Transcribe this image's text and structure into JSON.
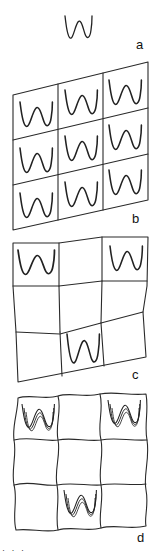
{
  "figure": {
    "panels": [
      {
        "id": "a",
        "label": "a",
        "description": "single double-well potential curve"
      },
      {
        "id": "b",
        "label": "b",
        "description": "3x3 parallelogram grid, each cell containing a double-well curve"
      },
      {
        "id": "c",
        "label": "c",
        "description": "distorted 3x3 grid, double-well curves in top-left, top-right and bottom-center cells only"
      },
      {
        "id": "d",
        "label": "d",
        "description": "wavy 3x3 grid, triple overlapping double-well curves in top-left, top-right and bottom-center cells"
      }
    ],
    "bottom_text_fragment": "· · ·"
  }
}
